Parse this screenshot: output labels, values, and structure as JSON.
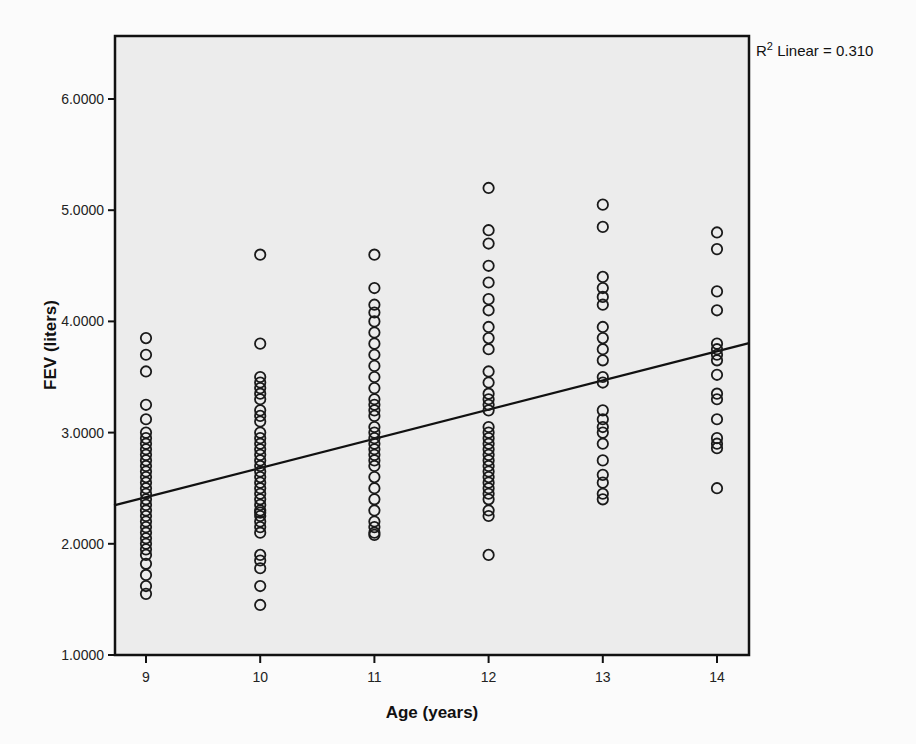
{
  "chart_data": {
    "type": "scatter",
    "title": "",
    "xlabel": "Age (years)",
    "ylabel": "FEV (liters)",
    "xlim": [
      8.7,
      14.3
    ],
    "ylim": [
      1.0,
      6.5
    ],
    "x_ticks": [
      9,
      10,
      11,
      12,
      13,
      14
    ],
    "x_tick_labels": [
      "9",
      "10",
      "11",
      "12",
      "13",
      "14"
    ],
    "y_ticks": [
      1.0,
      2.0,
      3.0,
      4.0,
      5.0,
      6.0
    ],
    "y_tick_labels": [
      "1.0000",
      "2.0000",
      "3.0000",
      "4.0000",
      "5.0000",
      "6.0000"
    ],
    "grid": false,
    "legend_text": {
      "prefix": "R",
      "sup": "2",
      "suffix": " Linear = 0.310"
    },
    "fit_line": {
      "type": "linear",
      "r_squared": 0.31,
      "x": [
        8.7,
        14.3
      ],
      "y": [
        2.34,
        3.81
      ]
    },
    "series": [
      {
        "name": "Age 9",
        "x": 9,
        "values": [
          3.85,
          3.7,
          3.55,
          3.25,
          3.12,
          3.0,
          2.95,
          2.9,
          2.85,
          2.8,
          2.75,
          2.7,
          2.65,
          2.6,
          2.55,
          2.5,
          2.45,
          2.4,
          2.35,
          2.3,
          2.25,
          2.2,
          2.15,
          2.1,
          2.05,
          2.0,
          1.95,
          1.9,
          1.82,
          1.72,
          1.62,
          1.55
        ]
      },
      {
        "name": "Age 10",
        "x": 10,
        "values": [
          4.6,
          3.8,
          3.5,
          3.45,
          3.4,
          3.35,
          3.3,
          3.2,
          3.15,
          3.1,
          3.0,
          2.95,
          2.9,
          2.85,
          2.8,
          2.75,
          2.7,
          2.65,
          2.6,
          2.55,
          2.5,
          2.45,
          2.4,
          2.35,
          2.3,
          2.28,
          2.25,
          2.2,
          2.15,
          2.1,
          1.9,
          1.85,
          1.78,
          1.62,
          1.45
        ]
      },
      {
        "name": "Age 11",
        "x": 11,
        "values": [
          4.6,
          4.3,
          4.15,
          4.08,
          4.0,
          3.9,
          3.8,
          3.7,
          3.6,
          3.5,
          3.4,
          3.3,
          3.25,
          3.2,
          3.15,
          3.05,
          3.0,
          2.95,
          2.9,
          2.85,
          2.8,
          2.75,
          2.7,
          2.6,
          2.5,
          2.4,
          2.3,
          2.2,
          2.15,
          2.1,
          2.08
        ]
      },
      {
        "name": "Age 12",
        "x": 12,
        "values": [
          5.2,
          4.82,
          4.7,
          4.5,
          4.35,
          4.2,
          4.1,
          3.95,
          3.85,
          3.75,
          3.55,
          3.45,
          3.35,
          3.3,
          3.25,
          3.2,
          3.05,
          3.0,
          2.95,
          2.9,
          2.85,
          2.8,
          2.75,
          2.7,
          2.65,
          2.6,
          2.55,
          2.5,
          2.45,
          2.4,
          2.3,
          2.25,
          1.9
        ]
      },
      {
        "name": "Age 13",
        "x": 13,
        "values": [
          5.05,
          4.85,
          4.4,
          4.3,
          4.22,
          4.15,
          3.95,
          3.85,
          3.75,
          3.65,
          3.5,
          3.45,
          3.2,
          3.12,
          3.05,
          3.0,
          2.9,
          2.75,
          2.62,
          2.55,
          2.45,
          2.4
        ]
      },
      {
        "name": "Age 14",
        "x": 14,
        "values": [
          4.8,
          4.65,
          4.27,
          4.1,
          3.8,
          3.75,
          3.7,
          3.65,
          3.52,
          3.35,
          3.3,
          3.12,
          2.95,
          2.9,
          2.86,
          2.5
        ]
      }
    ]
  },
  "colors": {
    "plot_background": "#ececec",
    "page_background": "#fbfbfb",
    "marker_stroke": "#1a1a1a",
    "axis": "#111111"
  }
}
